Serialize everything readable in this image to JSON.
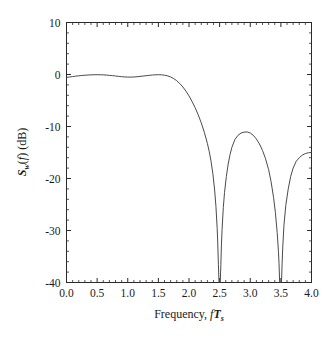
{
  "chart_data": {
    "type": "line",
    "title": "",
    "xlabel": "Frequency, fTs",
    "xlabel_parts": {
      "lead": "Frequency, ",
      "f": "f",
      "T": "T",
      "sub": "s"
    },
    "ylabel": "Sw(f) (dB)",
    "ylabel_parts": {
      "S": "S",
      "sub_w": "w",
      "paren_open": "(",
      "f": "f",
      "paren_close": ")",
      "unit": " (dB)"
    },
    "xlim": [
      0.0,
      4.0
    ],
    "ylim": [
      -40,
      10
    ],
    "xticks": [
      "0.0",
      "0.5",
      "1.0",
      "1.5",
      "2.0",
      "2.5",
      "3.0",
      "3.5",
      "4.0"
    ],
    "xtick_values": [
      0.0,
      0.5,
      1.0,
      1.5,
      2.0,
      2.5,
      3.0,
      3.5,
      4.0
    ],
    "xminor_count": 4,
    "yticks": [
      "10",
      "0",
      "-10",
      "-20",
      "-30",
      "-40"
    ],
    "ytick_values": [
      10,
      0,
      -10,
      -20,
      -30,
      -40
    ],
    "yminor_count": 4,
    "grid": false,
    "legend": "none",
    "line_color": "#4a4a4a",
    "axis_color": "#2a2a2a",
    "background": "#ffffff",
    "annotations": [],
    "series": [
      {
        "name": "Sw(f)",
        "x": [
          0.0,
          0.05,
          0.1,
          0.15,
          0.2,
          0.25,
          0.3,
          0.35,
          0.4,
          0.45,
          0.5,
          0.55,
          0.6,
          0.65,
          0.7,
          0.75,
          0.8,
          0.85,
          0.9,
          0.95,
          1.0,
          1.05,
          1.1,
          1.15,
          1.2,
          1.25,
          1.3,
          1.35,
          1.4,
          1.45,
          1.5,
          1.55,
          1.6,
          1.65,
          1.7,
          1.75,
          1.8,
          1.85,
          1.9,
          1.95,
          2.0,
          2.05,
          2.1,
          2.15,
          2.2,
          2.25,
          2.3,
          2.33,
          2.36,
          2.39,
          2.42,
          2.44,
          2.46,
          2.47,
          2.48,
          2.49,
          2.495,
          2.5,
          2.505,
          2.51,
          2.52,
          2.53,
          2.54,
          2.56,
          2.58,
          2.61,
          2.64,
          2.67,
          2.7,
          2.75,
          2.8,
          2.85,
          2.9,
          2.95,
          3.0,
          3.05,
          3.1,
          3.15,
          3.2,
          3.25,
          3.3,
          3.34,
          3.38,
          3.41,
          3.44,
          3.46,
          3.47,
          3.48,
          3.49,
          3.495,
          3.5,
          3.505,
          3.51,
          3.52,
          3.53,
          3.55,
          3.58,
          3.62,
          3.66,
          3.7,
          3.75,
          3.8,
          3.85,
          3.9,
          3.95,
          4.0
        ],
        "y": [
          -0.55,
          -0.48,
          -0.4,
          -0.32,
          -0.25,
          -0.19,
          -0.14,
          -0.1,
          -0.07,
          -0.05,
          -0.04,
          -0.05,
          -0.07,
          -0.11,
          -0.16,
          -0.22,
          -0.29,
          -0.36,
          -0.42,
          -0.47,
          -0.5,
          -0.5,
          -0.48,
          -0.43,
          -0.37,
          -0.3,
          -0.23,
          -0.16,
          -0.1,
          -0.06,
          -0.04,
          -0.06,
          -0.13,
          -0.26,
          -0.47,
          -0.78,
          -1.2,
          -1.74,
          -2.4,
          -3.2,
          -4.12,
          -5.18,
          -6.38,
          -7.74,
          -9.3,
          -11.1,
          -13.25,
          -14.8,
          -16.7,
          -19.1,
          -22.4,
          -25.4,
          -29.6,
          -32.6,
          -36.6,
          -40.0,
          -40.0,
          -40.0,
          -40.0,
          -40.0,
          -36.6,
          -32.6,
          -29.8,
          -25.6,
          -22.7,
          -19.6,
          -17.2,
          -15.4,
          -14.0,
          -12.5,
          -11.7,
          -11.25,
          -11.08,
          -11.05,
          -11.25,
          -11.7,
          -12.4,
          -13.35,
          -14.6,
          -16.2,
          -18.3,
          -20.6,
          -23.6,
          -26.5,
          -30.4,
          -34.0,
          -36.4,
          -40.0,
          -40.0,
          -40.0,
          -40.0,
          -40.0,
          -40.0,
          -36.4,
          -33.4,
          -29.0,
          -25.2,
          -22.0,
          -19.6,
          -18.0,
          -16.7,
          -16.0,
          -15.5,
          -15.2,
          -15.05,
          -15.0
        ]
      }
    ]
  }
}
